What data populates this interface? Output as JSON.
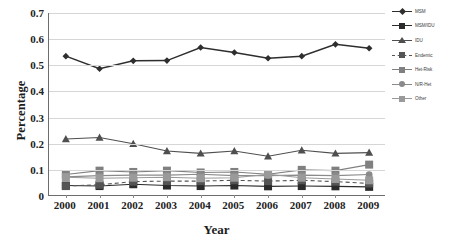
{
  "chart_data": {
    "type": "line",
    "title": "",
    "xlabel": "Year",
    "ylabel": "Percentage",
    "categories": [
      "2000",
      "2001",
      "2002",
      "2003",
      "2004",
      "2005",
      "2006",
      "2007",
      "2008",
      "2009"
    ],
    "x": [
      2000,
      2001,
      2002,
      2003,
      2004,
      2005,
      2006,
      2007,
      2008,
      2009
    ],
    "ylim": [
      0,
      0.7
    ],
    "yticks": [
      "0",
      "0.1",
      "0.2",
      "0.3",
      "0.4",
      "0.5",
      "0.6",
      "0.7"
    ],
    "ytick_values": [
      0,
      0.1,
      0.2,
      0.3,
      0.4,
      0.5,
      0.6,
      0.7
    ],
    "grid": true,
    "legend_position": "right",
    "series": [
      {
        "name": "MSM",
        "marker": "diamond",
        "linestyle": "solid",
        "color": "#2e2e2e",
        "values": [
          0.535,
          0.487,
          0.517,
          0.518,
          0.568,
          0.549,
          0.527,
          0.535,
          0.58,
          0.565
        ]
      },
      {
        "name": "MSM/IDU",
        "marker": "square",
        "linestyle": "solid",
        "color": "#2b2b2b",
        "values": [
          0.04,
          0.038,
          0.045,
          0.04,
          0.038,
          0.04,
          0.037,
          0.038,
          0.037,
          0.035
        ]
      },
      {
        "name": "IDU",
        "marker": "triangle",
        "linestyle": "solid",
        "color": "#4f4f4f",
        "values": [
          0.218,
          0.224,
          0.2,
          0.172,
          0.163,
          0.172,
          0.152,
          0.175,
          0.163,
          0.166
        ]
      },
      {
        "name": "Endemic",
        "marker": "square",
        "linestyle": "dashed",
        "color": "#555555",
        "values": [
          0.038,
          0.043,
          0.055,
          0.057,
          0.057,
          0.06,
          0.057,
          0.06,
          0.055,
          0.048
        ]
      },
      {
        "name": "Het-Risk",
        "marker": "square",
        "linestyle": "solid",
        "color": "#808080",
        "values": [
          0.082,
          0.097,
          0.092,
          0.097,
          0.09,
          0.092,
          0.083,
          0.1,
          0.097,
          0.12
        ]
      },
      {
        "name": "N/R-Het",
        "marker": "circle",
        "linestyle": "solid",
        "color": "#8a8a8a",
        "values": [
          0.073,
          0.078,
          0.08,
          0.08,
          0.083,
          0.078,
          0.078,
          0.08,
          0.078,
          0.082
        ]
      },
      {
        "name": "Other",
        "marker": "square",
        "linestyle": "solid",
        "color": "#9a9a9a",
        "values": [
          0.072,
          0.068,
          0.07,
          0.072,
          0.068,
          0.07,
          0.083,
          0.07,
          0.065,
          0.06
        ]
      }
    ]
  }
}
